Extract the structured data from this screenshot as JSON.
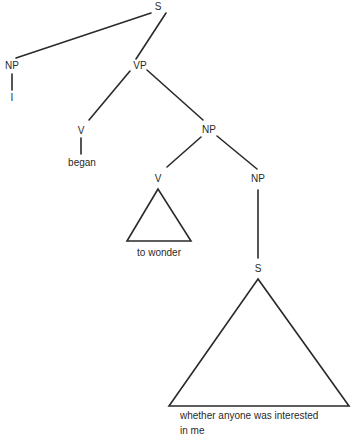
{
  "tree": {
    "nodes": {
      "s_root": "S",
      "np_subject": "NP",
      "vp": "VP",
      "v_main": "V",
      "np_object": "NP",
      "v_inner": "V",
      "np_inner": "NP",
      "s_embedded": "S"
    },
    "leaves": {
      "subject": "I",
      "main_verb": "began",
      "inner_verb": "to wonder",
      "clause_line1": "whether anyone was interested",
      "clause_line2": "in me"
    },
    "line_color": "#2a2a2a"
  }
}
